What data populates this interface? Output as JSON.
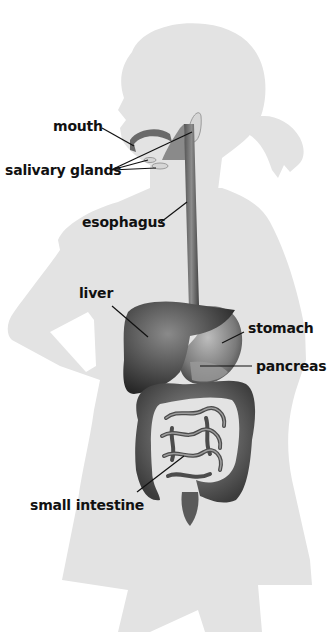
{
  "diagram": {
    "silhouette_color": "#e3e3e3",
    "organ_color": "#5a5a5a",
    "leader_line_color": "#111111",
    "labels": [
      {
        "id": "mouth",
        "text": "mouth"
      },
      {
        "id": "salivary-glands",
        "text": "salivary glands"
      },
      {
        "id": "esophagus",
        "text": "esophagus"
      },
      {
        "id": "liver",
        "text": "liver"
      },
      {
        "id": "stomach",
        "text": "stomach"
      },
      {
        "id": "pancreas",
        "text": "pancreas"
      },
      {
        "id": "small-intestine",
        "text": "small intestine"
      }
    ]
  }
}
